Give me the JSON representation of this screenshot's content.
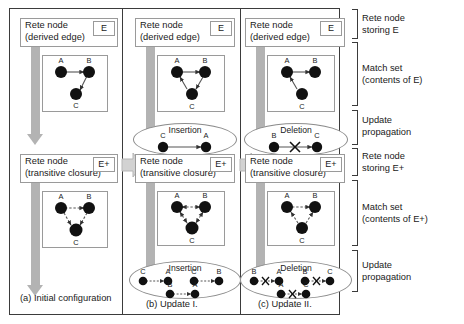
{
  "figure": {
    "node_label_color": "#111111",
    "arrow_color": "#b3b3b3",
    "frame_color": "#3b3b3b"
  },
  "columns": [
    {
      "caption": "(a) Initial configuration",
      "top": {
        "node_title": "Rete node",
        "node_subtitle": "(derived edge)",
        "tag": "E",
        "graph": {
          "nodes": [
            "A",
            "B",
            "C"
          ],
          "edges": [
            "A->B",
            "B->C"
          ],
          "style": "solid"
        },
        "delta": null
      },
      "bottom": {
        "node_title": "Rete node",
        "node_subtitle": "(transitive closure)",
        "tag": "E+",
        "graph": {
          "nodes": [
            "A",
            "B",
            "C"
          ],
          "edges": [
            "A->B",
            "B->C",
            "A->C"
          ],
          "style": "dashed"
        },
        "delta": null
      }
    },
    {
      "caption": "(b) Update I.",
      "top": {
        "node_title": "Rete node",
        "node_subtitle": "(derived edge)",
        "tag": "E",
        "graph": {
          "nodes": [
            "A",
            "B",
            "C"
          ],
          "edges": [
            "A->B",
            "B->C",
            "C->A"
          ],
          "style": "solid"
        },
        "delta": {
          "kind": "Insertion",
          "label": "Insertion",
          "pairs": [
            {
              "from": "C",
              "to": "A",
              "crossed": false
            }
          ]
        }
      },
      "bottom": {
        "node_title": "Rete node",
        "node_subtitle": "(transitive closure)",
        "tag": "E+",
        "graph": {
          "nodes": [
            "A",
            "B",
            "C"
          ],
          "edges": [
            "A->B",
            "B->A",
            "B->C",
            "C->B",
            "A->C",
            "C->A"
          ],
          "style": "dashed"
        },
        "delta": {
          "kind": "Insertion",
          "label": "Insertion",
          "pairs": [
            {
              "from": "C",
              "to": "A",
              "crossed": false
            },
            {
              "from": "C",
              "to": "B",
              "crossed": false
            },
            {
              "from": "B",
              "to": "A",
              "crossed": false
            }
          ]
        }
      }
    },
    {
      "caption": "(c) Update II.",
      "top": {
        "node_title": "Rete node",
        "node_subtitle": "(derived edge)",
        "tag": "E",
        "graph": {
          "nodes": [
            "A",
            "B",
            "C"
          ],
          "edges": [
            "A->B",
            "C->A"
          ],
          "style": "solid"
        },
        "delta": {
          "kind": "Deletion",
          "label": "Deletion",
          "pairs": [
            {
              "from": "B",
              "to": "C",
              "crossed": true
            }
          ]
        }
      },
      "bottom": {
        "node_title": "Rete node",
        "node_subtitle": "(transitive closure)",
        "tag": "E+",
        "graph": {
          "nodes": [
            "A",
            "B",
            "C"
          ],
          "edges": [
            "A->B",
            "C->A",
            "C->B"
          ],
          "style": "dashed"
        },
        "delta": {
          "kind": "Deletion",
          "label": "Deletion",
          "pairs": [
            {
              "from": "B",
              "to": "A",
              "crossed": true
            },
            {
              "from": "B",
              "to": "C",
              "crossed": true
            },
            {
              "from": "A",
              "to": "C",
              "crossed": true
            }
          ]
        }
      }
    }
  ],
  "legend": [
    {
      "id": "rete-node-e",
      "line1": "Rete node",
      "line2": "storing E"
    },
    {
      "id": "match-set-e",
      "line1": "Match set",
      "line2": "(contents of E)"
    },
    {
      "id": "update-prop-1",
      "line1": "Update",
      "line2": "propagation"
    },
    {
      "id": "rete-node-ep",
      "line1": "Rete node",
      "line2": "storing E+"
    },
    {
      "id": "match-set-ep",
      "line1": "Match set",
      "line2": "(contents of E+)"
    },
    {
      "id": "update-prop-2",
      "line1": "Update",
      "line2": "propagation"
    }
  ]
}
